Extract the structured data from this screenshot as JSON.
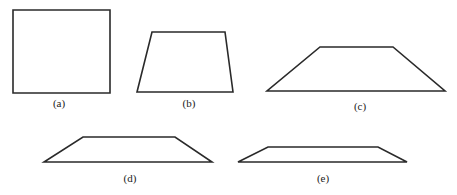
{
  "figure": {
    "shapes": [
      {
        "id": "a",
        "label": "(a)",
        "kind": "square",
        "points": "13,10 110,10 110,93 13,93",
        "label_x": 59,
        "label_y": 107
      },
      {
        "id": "b",
        "label": "(b)",
        "kind": "trapezoid",
        "points": "152,32 225,32 233,92 137,92",
        "label_x": 189,
        "label_y": 107
      },
      {
        "id": "c",
        "label": "(c)",
        "kind": "trapezoid",
        "points": "320,47 393,47 445,91 267,91",
        "label_x": 360,
        "label_y": 110
      },
      {
        "id": "d",
        "label": "(d)",
        "kind": "trapezoid",
        "points": "83,137 175,137 212,162 44,162",
        "label_x": 130,
        "label_y": 182
      },
      {
        "id": "e",
        "label": "(e)",
        "kind": "trapezoid",
        "points": "268,147 378,147 407,162 238,162",
        "label_x": 323,
        "label_y": 182
      }
    ]
  }
}
